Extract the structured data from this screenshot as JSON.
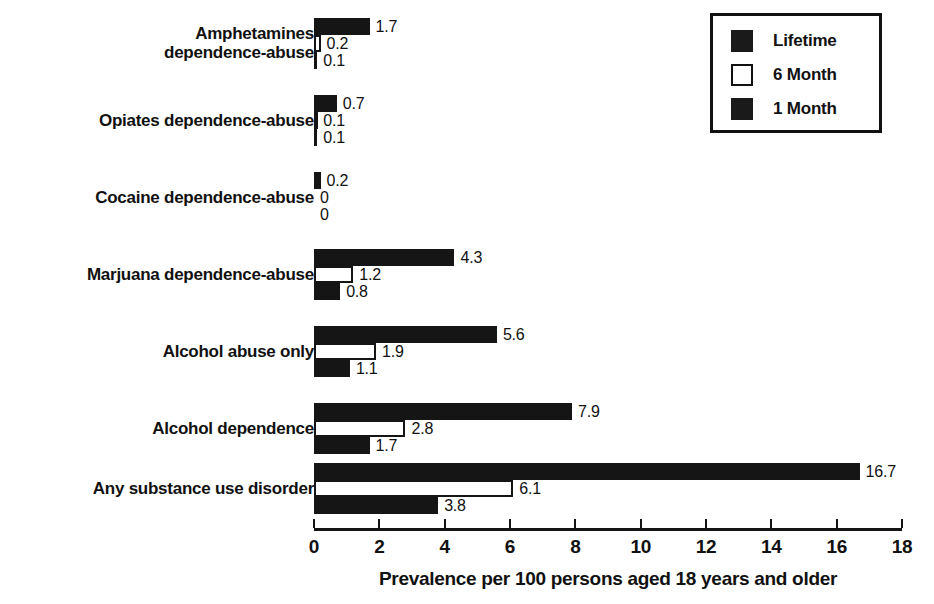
{
  "chart_data": {
    "type": "bar",
    "orientation": "horizontal",
    "title": "",
    "xlabel": "Prevalence per 100 persons aged 18 years and older",
    "ylabel": "",
    "xlim": [
      0,
      18
    ],
    "xticks": [
      0,
      2,
      4,
      6,
      8,
      10,
      12,
      14,
      16,
      18
    ],
    "xtick_labels": [
      "0",
      "2",
      "4",
      "6",
      "8",
      "10",
      "12",
      "14",
      "16",
      "18"
    ],
    "grid": false,
    "legend_position": "top-right",
    "categories": [
      "Amphetamines\ndependence-abuse",
      "Opiates dependence-abuse",
      "Cocaine dependence-abuse",
      "Marjuana dependence-abuse",
      "Alcohol abuse only",
      "Alcohol dependence",
      "Any substance use disorder"
    ],
    "series": [
      {
        "name": "Lifetime",
        "style": "filled",
        "color": "#151515",
        "values": [
          1.7,
          0.7,
          0.2,
          4.3,
          5.6,
          7.9,
          16.7
        ],
        "labels": [
          "1.7",
          "0.7",
          "0.2",
          "4.3",
          "5.6",
          "7.9",
          "16.7"
        ]
      },
      {
        "name": "6 Month",
        "style": "open",
        "color": "#ffffff",
        "values": [
          0.2,
          0.1,
          0,
          1.2,
          1.9,
          2.8,
          6.1
        ],
        "labels": [
          "0.2",
          "0.1",
          "0",
          "1.2",
          "1.9",
          "2.8",
          "6.1"
        ]
      },
      {
        "name": "1 Month",
        "style": "filled",
        "color": "#151515",
        "values": [
          0.1,
          0.1,
          0,
          0.8,
          1.1,
          1.7,
          3.8
        ],
        "labels": [
          "0.1",
          "0.1",
          "0",
          "0.8",
          "1.1",
          "1.7",
          "3.8"
        ]
      }
    ]
  },
  "legend": {
    "items": [
      {
        "label": "Lifetime",
        "style": "filled"
      },
      {
        "label": "6 Month",
        "style": "open"
      },
      {
        "label": "1 Month",
        "style": "filled"
      }
    ]
  },
  "axis": {
    "xlabel": "Prevalence per 100 persons aged 18 years and older"
  },
  "colors": {
    "bar_fill": "#151515",
    "bar_open": "#ffffff",
    "text": "#111111",
    "background": "#ffffff"
  }
}
